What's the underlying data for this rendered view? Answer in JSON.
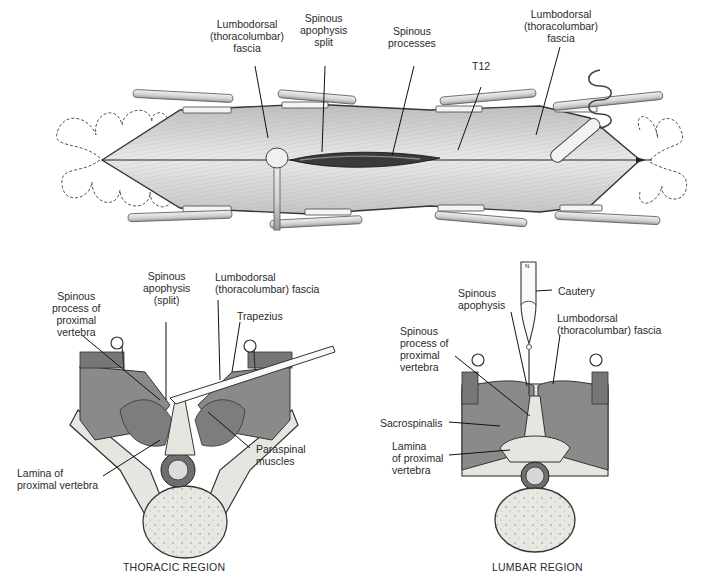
{
  "figure": {
    "top_panel": {
      "name": "Posterior midline incision over spine (dorsal view)",
      "labels": [
        {
          "id": "fascia_left",
          "text": "Lumbodorsal\n(thoracolumbar)\nfascia"
        },
        {
          "id": "apophysis_split",
          "text": "Spinous\napophysis\nsplit"
        },
        {
          "id": "spinous_processes",
          "text": "Spinous\nprocesses"
        },
        {
          "id": "t12",
          "text": "T12"
        },
        {
          "id": "fascia_right",
          "text": "Lumbodorsal\n(thoracolumbar)\nfascia"
        }
      ]
    },
    "thoracic_panel": {
      "caption": "THORACIC REGION",
      "labels": [
        {
          "id": "spinous_process_proximal",
          "text": "Spinous\nprocess of\nproximal\nvertebra"
        },
        {
          "id": "apophysis_split",
          "text": "Spinous\napophysis\n(split)"
        },
        {
          "id": "fascia",
          "text": "Lumbodorsal\n(thoracolumbar) fascia"
        },
        {
          "id": "trapezius",
          "text": "Trapezius"
        },
        {
          "id": "paraspinal",
          "text": "Paraspinal\nmuscles"
        },
        {
          "id": "lamina",
          "text": "Lamina of\nproximal vertebra"
        }
      ]
    },
    "lumbar_panel": {
      "caption": "LUMBAR REGION",
      "labels": [
        {
          "id": "spinous_apophysis",
          "text": "Spinous\napophysis"
        },
        {
          "id": "cautery",
          "text": "Cautery"
        },
        {
          "id": "fascia",
          "text": "Lumbodorsal\n(thoracolumbar) fascia"
        },
        {
          "id": "spinous_process_proximal",
          "text": "Spinous\nprocess of\nproximal\nvertebra"
        },
        {
          "id": "sacrospinalis",
          "text": "Sacrospinalis"
        },
        {
          "id": "lamina",
          "text": "Lamina\nof proximal\nvertebra"
        }
      ],
      "cautery_tip_mark": "N"
    },
    "colors": {
      "muscle": "#8a8a8a",
      "muscle_dark": "#6f6f6f",
      "bone": "#e6e6e0",
      "fascia": "#d2d2d2",
      "outline": "#2b2b2b",
      "background": "#ffffff"
    }
  }
}
